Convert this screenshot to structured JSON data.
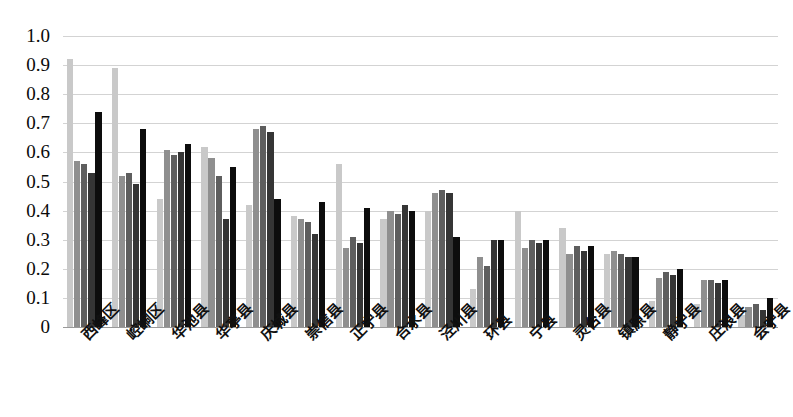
{
  "chart_data": {
    "type": "bar",
    "title": "",
    "subtitle": "",
    "xlabel": "",
    "ylabel": "",
    "ylim": [
      0,
      1.0
    ],
    "grid": true,
    "legend": "none",
    "ytick_labels": [
      "1.0",
      "0.9",
      "0.8",
      "0.7",
      "0.6",
      "0.5",
      "0.4",
      "0.3",
      "0.2",
      "0.1",
      "0"
    ],
    "ytick_values": [
      1.0,
      0.9,
      0.8,
      0.7,
      0.6,
      0.5,
      0.4,
      0.3,
      0.2,
      0.1,
      0
    ],
    "categories": [
      "西峰区",
      "崆峒区",
      "华池县",
      "华亭县",
      "庆城县",
      "崇信县",
      "正宁县",
      "合水县",
      "泾川县",
      "环县",
      "宁县",
      "灵台县",
      "镇原县",
      "静宁县",
      "庄浪县",
      "会宁县"
    ],
    "series": [
      {
        "name": "series-1",
        "color": "#c9c9c9",
        "values": [
          0.92,
          0.89,
          0.44,
          0.62,
          0.42,
          0.38,
          0.56,
          0.37,
          0.4,
          0.13,
          0.4,
          0.34,
          0.25,
          0.09,
          0.08,
          0.04
        ]
      },
      {
        "name": "series-2",
        "color": "#8f8f8f",
        "values": [
          0.57,
          0.52,
          0.61,
          0.58,
          0.68,
          0.37,
          0.27,
          0.4,
          0.46,
          0.24,
          0.27,
          0.25,
          0.26,
          0.17,
          0.16,
          0.07
        ]
      },
      {
        "name": "series-3",
        "color": "#5e5e5e",
        "values": [
          0.56,
          0.53,
          0.59,
          0.52,
          0.69,
          0.36,
          0.31,
          0.39,
          0.47,
          0.21,
          0.3,
          0.28,
          0.25,
          0.19,
          0.16,
          0.08
        ]
      },
      {
        "name": "series-4",
        "color": "#353535",
        "values": [
          0.53,
          0.49,
          0.6,
          0.37,
          0.67,
          0.32,
          0.29,
          0.42,
          0.46,
          0.3,
          0.29,
          0.26,
          0.24,
          0.18,
          0.15,
          0.06
        ]
      },
      {
        "name": "series-5",
        "color": "#0d0d0d",
        "values": [
          0.74,
          0.68,
          0.63,
          0.55,
          0.44,
          0.43,
          0.41,
          0.4,
          0.31,
          0.3,
          0.3,
          0.28,
          0.24,
          0.2,
          0.16,
          0.1
        ]
      }
    ]
  }
}
